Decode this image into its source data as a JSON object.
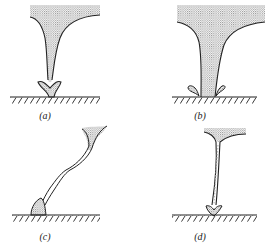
{
  "figure": {
    "panels": [
      {
        "id": "a",
        "label": "(a)"
      },
      {
        "id": "b",
        "label": "(b)"
      },
      {
        "id": "c",
        "label": "(c)"
      },
      {
        "id": "d",
        "label": "(d)"
      }
    ],
    "colors": {
      "ink": "#222222",
      "stipple": "#9a9a9a",
      "background": "#ffffff"
    }
  }
}
